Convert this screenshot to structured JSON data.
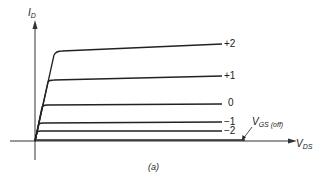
{
  "figure": {
    "y_axis_label": "I",
    "y_axis_sub": "D",
    "x_axis_label": "V",
    "x_axis_sub": "DS",
    "caption": "(a)",
    "cutoff_label": "V",
    "cutoff_sub": "GS (off)"
  },
  "curves": [
    {
      "label": "+2"
    },
    {
      "label": "+1"
    },
    {
      "label": "0"
    },
    {
      "label": "−1"
    },
    {
      "label": "−2"
    }
  ],
  "colors": {
    "line": "#222222",
    "axis": "#333333"
  }
}
